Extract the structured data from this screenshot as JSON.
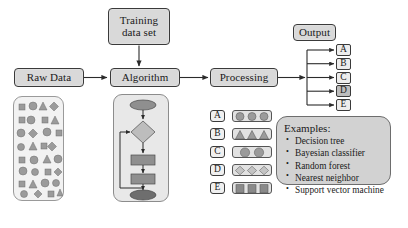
{
  "diagram": {
    "colors": {
      "box_fill": "#d9d9d9",
      "panel_fill": "#e8e8e8",
      "shape_fill": "#9e9e9e",
      "stroke": "#3a3a3a",
      "selected_chip": "#bdbdbd"
    }
  },
  "flow": {
    "training_data": {
      "line1": "Training",
      "line2": "data set"
    },
    "raw_data": {
      "label": "Raw Data"
    },
    "algorithm": {
      "label": "Algorithm"
    },
    "processing": {
      "label": "Processing"
    },
    "output": {
      "label": "Output"
    }
  },
  "outputs": {
    "items": [
      {
        "label": "A",
        "selected": false
      },
      {
        "label": "B",
        "selected": false
      },
      {
        "label": "C",
        "selected": false
      },
      {
        "label": "D",
        "selected": true
      },
      {
        "label": "E",
        "selected": false
      }
    ]
  },
  "legend": {
    "rows": [
      {
        "label": "A",
        "shape": "circle",
        "count": 3
      },
      {
        "label": "B",
        "shape": "triangle",
        "count": 3
      },
      {
        "label": "C",
        "shape": "circle",
        "count": 2
      },
      {
        "label": "D",
        "shape": "diamond",
        "count": 3
      },
      {
        "label": "E",
        "shape": "square",
        "count": 3
      }
    ]
  },
  "examples": {
    "title": "Examples:",
    "items": [
      "Decision tree",
      "Bayesian classifier",
      "Random forest",
      "Nearest neighbor",
      "Support vector machine"
    ]
  },
  "raw_data_cloud": {
    "description": "Unlabeled mixed shapes scatter",
    "shapes": [
      "square",
      "circle",
      "triangle",
      "diamond"
    ]
  },
  "algorithm_flowchart": {
    "description": "Internal algorithm flowchart with loop-back",
    "nodes": [
      "start-ellipse",
      "decision-diamond",
      "process-step-1",
      "process-step-2",
      "end-ellipse"
    ]
  }
}
